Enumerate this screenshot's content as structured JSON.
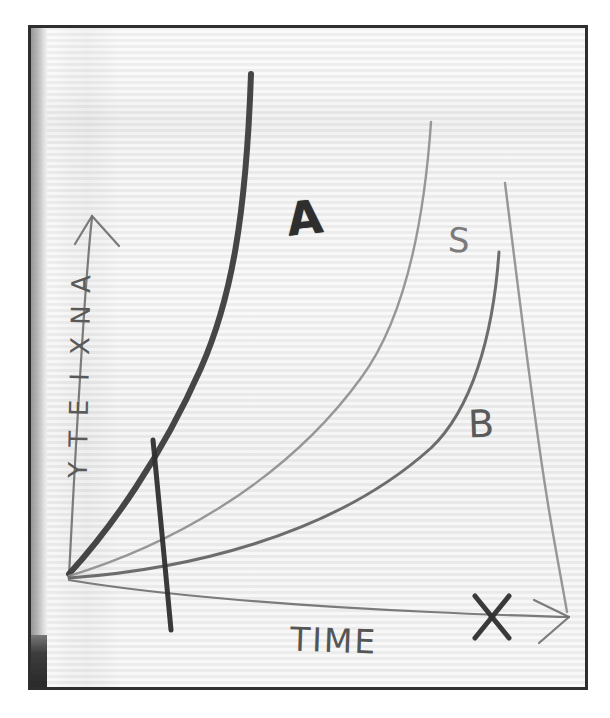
{
  "figure": {
    "medium": "hand-drawn pencil sketch photographed on paper",
    "frame_color": "#2e2e2e",
    "paper_color": "#f1f1f1",
    "ink_color": "#4a4a4a"
  },
  "axes": {
    "y_label": "ANXIETY",
    "x_label": "TIME",
    "y_arrow": "arrow-up",
    "x_arrow": "arrow-right"
  },
  "annotations": {
    "curve_a_label": "A",
    "curve_s_label": "S",
    "curve_b_label": "B",
    "x_mark_label": "X"
  },
  "chart_data": {
    "type": "line",
    "title": "",
    "subtitle": "",
    "xlabel": "TIME",
    "ylabel": "ANXIETY",
    "xlim": [
      0,
      10
    ],
    "ylim": [
      0,
      10
    ],
    "grid": false,
    "legend": "inline-curve-labels",
    "axis_style": "hand-drawn arrows, unlabeled ticks",
    "annotations": [
      {
        "text": "A",
        "x": 2.6,
        "y": 7.4,
        "note": "label on the steep dark curve"
      },
      {
        "text": "S",
        "x": 6.6,
        "y": 6.9,
        "note": "label on the middle grey curve"
      },
      {
        "text": "B",
        "x": 7.3,
        "y": 4.1,
        "note": "label on the lower grey curve"
      },
      {
        "text": "X",
        "x": 8.6,
        "y": 0.05,
        "note": "cross mark on the time axis near the right end"
      }
    ],
    "series": [
      {
        "name": "A",
        "style": "thick dark exponential rise",
        "x": [
          0.0,
          0.6,
          1.2,
          1.8,
          2.3,
          2.8,
          3.1,
          3.3
        ],
        "y": [
          0.0,
          1.1,
          2.5,
          4.3,
          6.3,
          8.3,
          9.4,
          10.0
        ]
      },
      {
        "name": "S",
        "style": "thin grey exponential rise, slower than A",
        "x": [
          0.0,
          1.3,
          2.6,
          3.9,
          5.0,
          6.0,
          6.7,
          7.2
        ],
        "y": [
          0.0,
          0.6,
          1.4,
          2.6,
          4.2,
          6.2,
          8.0,
          9.3
        ]
      },
      {
        "name": "B",
        "style": "thin grey exponential rise, slowest of the three",
        "x": [
          0.0,
          1.6,
          3.2,
          4.8,
          6.0,
          7.0,
          7.8,
          8.5
        ],
        "y": [
          0.0,
          0.35,
          0.9,
          1.8,
          2.9,
          4.1,
          5.5,
          7.0
        ]
      },
      {
        "name": "descending-tail",
        "style": "thin grey curve falling from upper right down to the time axis",
        "x": [
          8.7,
          8.9,
          9.2,
          9.6,
          10.0,
          10.3
        ],
        "y": [
          9.0,
          7.4,
          5.4,
          3.4,
          1.6,
          0.2
        ]
      }
    ],
    "marks": [
      {
        "name": "slash",
        "style": "short steep stroke crossing curve A near the origin",
        "x0": 1.0,
        "y0": 4.4,
        "x1": 1.3,
        "y1": 0.0
      }
    ]
  }
}
